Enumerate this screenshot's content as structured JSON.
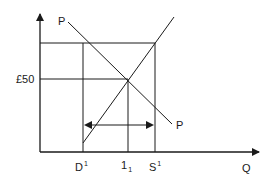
{
  "diagram": {
    "type": "supply-demand",
    "y_axis_label": "£50",
    "x_axis_label": "Q",
    "curves": [
      {
        "name": "demand",
        "label_top": "P",
        "label_bottom": "P"
      },
      {
        "name": "supply"
      }
    ],
    "x_ticks": [
      {
        "base": "D",
        "script": "1",
        "kind": "sup"
      },
      {
        "base": "1",
        "script": "1",
        "kind": "sub"
      },
      {
        "base": "S",
        "script": "1",
        "kind": "sup"
      }
    ],
    "arrow": {
      "type": "double-headed",
      "from": "D1",
      "to": "S1"
    },
    "colors": {
      "line": "#1a1a1a",
      "background": "#ffffff"
    }
  }
}
